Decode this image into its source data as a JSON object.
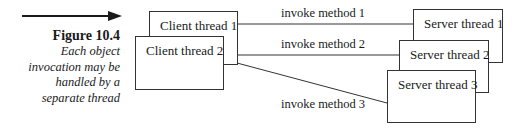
{
  "figure": {
    "number": "Figure 10.4",
    "caption_lines": [
      "Each object",
      "invocation may be",
      "handled by a",
      "separate thread"
    ]
  },
  "diagram": {
    "clients": [
      {
        "label": "Client thread 1"
      },
      {
        "label": "Client thread 2"
      }
    ],
    "servers": [
      {
        "label": "Server thread 1"
      },
      {
        "label": "Server thread 2"
      },
      {
        "label": "Server thread 3"
      }
    ],
    "invocations": [
      {
        "label": "invoke method 1",
        "from": "Client thread 1",
        "to": "Server thread 1"
      },
      {
        "label": "invoke method 2",
        "from": "Client thread 2",
        "to": "Server thread 2"
      },
      {
        "label": "invoke method 3",
        "from": "Client thread 2",
        "to": "Server thread 3"
      }
    ]
  }
}
